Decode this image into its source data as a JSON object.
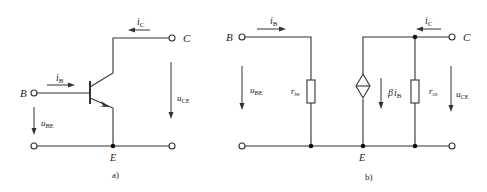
{
  "panels": [
    {
      "caption": "a)",
      "terminals": {
        "base": "B",
        "collector": "C",
        "emitter": "E"
      },
      "currents": {
        "base": {
          "sym": "i",
          "sub": "B"
        },
        "collector": {
          "sym": "i",
          "sub": "C"
        }
      },
      "voltages": {
        "be": {
          "sym": "u",
          "sub": "BE"
        },
        "ce": {
          "sym": "u",
          "sub": "CE"
        }
      },
      "component": "npn-transistor"
    },
    {
      "caption": "b)",
      "terminals": {
        "base": "B",
        "collector": "C",
        "emitter": "E"
      },
      "currents": {
        "base": {
          "sym": "i",
          "sub": "B"
        },
        "collector": {
          "sym": "i",
          "sub": "C"
        }
      },
      "voltages": {
        "be": {
          "sym": "u",
          "sub": "BE"
        },
        "ce": {
          "sym": "u",
          "sub": "CE"
        }
      },
      "resistors": [
        {
          "sym": "r",
          "sub": "be"
        },
        {
          "sym": "r",
          "sub": "ce"
        }
      ],
      "dependent_source": {
        "beta": "β",
        "sym": "i",
        "sub": "B"
      }
    }
  ],
  "colors": {
    "line": "#333333",
    "text": "#222222",
    "background": "#ffffff"
  }
}
